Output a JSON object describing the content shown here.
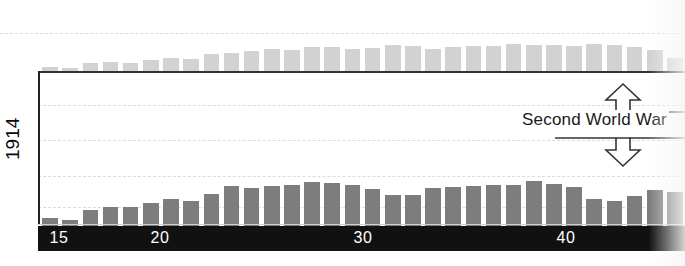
{
  "figure": {
    "axis_label_rotated": "1914",
    "annotation_label": "Second World War",
    "year_ticks": [
      {
        "label": "15",
        "x": 59
      },
      {
        "label": "20",
        "x": 160
      },
      {
        "label": "30",
        "x": 363
      },
      {
        "label": "40",
        "x": 566
      }
    ],
    "colors": {
      "upper_bar": "#d2d2d2",
      "lower_bar": "#7d7d7d",
      "band": "#111111",
      "gridline": "#dcdcdc",
      "baseline": "#333333",
      "text_on_band": "#ffffff",
      "text": "#1a1a1a"
    },
    "gridlines_y": [
      33,
      105,
      140,
      176,
      207
    ],
    "baseline_y": 71,
    "band_y": 226
  },
  "chart_data": {
    "type": "bar",
    "title": "",
    "subtitle": "",
    "xlabel": "",
    "ylabel": "1914",
    "grid": true,
    "legend_position": "none",
    "annotations": [
      {
        "text": "Second World War",
        "x_year": 1940,
        "kind": "vertical-double-arrow"
      }
    ],
    "axis_ranges": {
      "x_years": [
        1913,
        1945
      ]
    },
    "x_tick_labels": [
      "15",
      "20",
      "30",
      "40"
    ],
    "categories": [
      "1913",
      "1914",
      "1915",
      "1916",
      "1917",
      "1918",
      "1919",
      "1920",
      "1921",
      "1922",
      "1923",
      "1924",
      "1925",
      "1926",
      "1927",
      "1928",
      "1929",
      "1930",
      "1931",
      "1932",
      "1933",
      "1934",
      "1935",
      "1936",
      "1937",
      "1938",
      "1939",
      "1940",
      "1941",
      "1942",
      "1943",
      "1944"
    ],
    "series": [
      {
        "name": "upper-series",
        "orientation": "up-from-top-baseline",
        "color": "#d2d2d2",
        "values": [
          4,
          3,
          8,
          9,
          8,
          11,
          13,
          12,
          17,
          18,
          20,
          22,
          21,
          24,
          24,
          22,
          23,
          26,
          25,
          22,
          24,
          25,
          25,
          27,
          26,
          26,
          25,
          27,
          26,
          24,
          21,
          13
        ]
      },
      {
        "name": "lower-series",
        "orientation": "up-from-bottom-band",
        "color": "#7d7d7d",
        "values": [
          8,
          6,
          16,
          19,
          19,
          23,
          27,
          25,
          32,
          40,
          38,
          40,
          41,
          44,
          43,
          41,
          37,
          31,
          31,
          38,
          39,
          40,
          41,
          41,
          45,
          42,
          39,
          27,
          25,
          30,
          36,
          34
        ]
      }
    ]
  }
}
